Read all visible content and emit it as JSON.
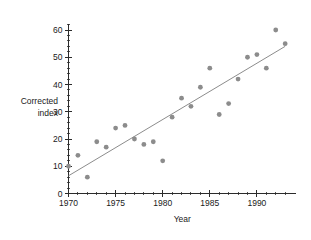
{
  "chart_data": {
    "type": "scatter",
    "title": "",
    "xlabel": "Year",
    "ylabel_line1": "Corrected",
    "ylabel_line2": "index",
    "xlim": [
      1969.3,
      1993.8
    ],
    "ylim": [
      0,
      63
    ],
    "grid": false,
    "legend": "none",
    "x_ticks": [
      1970,
      1975,
      1980,
      1985,
      1990
    ],
    "x_tick_labels": [
      "1970",
      "1975",
      "1980",
      "1985",
      "1990"
    ],
    "x_minor_step": 1,
    "y_ticks": [
      0,
      10,
      20,
      30,
      40,
      50,
      60
    ],
    "y_tick_labels": [
      "0",
      "10",
      "20",
      "30",
      "40",
      "50",
      "60"
    ],
    "y_minor_step": 2,
    "marker_color": "#8c8c8c",
    "marker_radius": 2.4,
    "line_color": "#8c8c8c",
    "axis_color": "#2b2b2b",
    "x": [
      1970,
      1971,
      1972,
      1973,
      1974,
      1975,
      1976,
      1977,
      1978,
      1979,
      1980,
      1981,
      1982,
      1983,
      1984,
      1985,
      1986,
      1987,
      1988,
      1989,
      1990,
      1991,
      1992,
      1993
    ],
    "y": [
      10,
      14,
      6,
      19,
      17,
      24,
      25,
      20,
      18,
      19,
      12,
      28,
      35,
      32,
      39,
      46,
      29,
      33,
      42,
      50,
      51,
      46,
      60,
      55
    ],
    "points": [
      {
        "x": 1970,
        "y": 10
      },
      {
        "x": 1971,
        "y": 14
      },
      {
        "x": 1972,
        "y": 6
      },
      {
        "x": 1973,
        "y": 19
      },
      {
        "x": 1974,
        "y": 17
      },
      {
        "x": 1975,
        "y": 24
      },
      {
        "x": 1976,
        "y": 25
      },
      {
        "x": 1977,
        "y": 20
      },
      {
        "x": 1978,
        "y": 18
      },
      {
        "x": 1979,
        "y": 19
      },
      {
        "x": 1980,
        "y": 12
      },
      {
        "x": 1981,
        "y": 28
      },
      {
        "x": 1982,
        "y": 35
      },
      {
        "x": 1983,
        "y": 32
      },
      {
        "x": 1984,
        "y": 39
      },
      {
        "x": 1985,
        "y": 46
      },
      {
        "x": 1986,
        "y": 29
      },
      {
        "x": 1987,
        "y": 33
      },
      {
        "x": 1988,
        "y": 42
      },
      {
        "x": 1989,
        "y": 50
      },
      {
        "x": 1990,
        "y": 51
      },
      {
        "x": 1991,
        "y": 46
      },
      {
        "x": 1992,
        "y": 60
      },
      {
        "x": 1993,
        "y": 55
      }
    ],
    "trend_line": {
      "name": "fitted regression line",
      "x_start": 1970,
      "y_start": 6.5,
      "x_end": 1993,
      "y_end": 54
    }
  }
}
